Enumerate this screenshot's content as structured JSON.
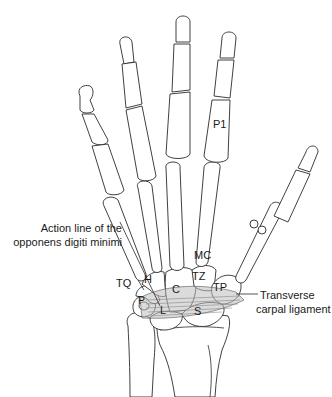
{
  "figure": {
    "bone_labels": {
      "P1": "P1",
      "MC": "MC",
      "TQ": "TQ",
      "H": "H",
      "C": "C",
      "TZ": "TZ",
      "TP": "TP",
      "P": "P",
      "L": "L",
      "S": "S"
    },
    "callouts": {
      "opponens_line1": "Action line of the",
      "opponens_line2": "opponens digiti minimi",
      "ligament_line1": "Transverse",
      "ligament_line2": "carpal ligament"
    },
    "colors": {
      "line": "#2b2b2b",
      "ligament_fill": "#bdbdbd",
      "background": "#ffffff"
    }
  }
}
